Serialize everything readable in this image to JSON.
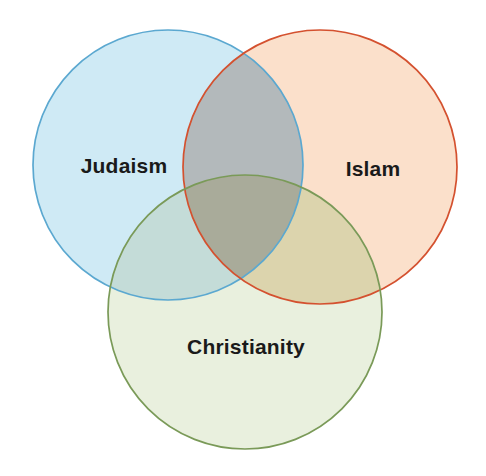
{
  "diagram": {
    "type": "venn",
    "set_count": 3,
    "background_color": "#ffffff",
    "width": 486,
    "height": 476,
    "sets": [
      {
        "id": "judaism",
        "label": "Judaism",
        "fill_color": "#cfeaf5",
        "stroke_color": "#5ba8d0",
        "label_color": "#1a1a1a",
        "center_x": 168,
        "center_y": 165,
        "radius": 135,
        "label_x": 124,
        "label_y": 166
      },
      {
        "id": "islam",
        "label": "Islam",
        "fill_color": "#fbe0cb",
        "stroke_color": "#d4512f",
        "label_color": "#1a1a1a",
        "center_x": 320,
        "center_y": 167,
        "radius": 137,
        "label_x": 373,
        "label_y": 169
      },
      {
        "id": "christianity",
        "label": "Christianity",
        "fill_color": "#e9f0de",
        "stroke_color": "#7a9a58",
        "label_color": "#1a1a1a",
        "center_x": 245,
        "center_y": 312,
        "radius": 137,
        "label_x": 246,
        "label_y": 347
      }
    ],
    "intersections": [
      {
        "id": "judaism-islam",
        "sets": [
          "judaism",
          "islam"
        ],
        "fill_color": "#b3b9bb",
        "label": ""
      },
      {
        "id": "judaism-christianity",
        "sets": [
          "judaism",
          "christianity"
        ],
        "fill_color": "#c4dcd8",
        "label": ""
      },
      {
        "id": "islam-christianity",
        "sets": [
          "islam",
          "christianity"
        ],
        "fill_color": "#dcd4ad",
        "label": ""
      },
      {
        "id": "judaism-islam-christianity",
        "sets": [
          "judaism",
          "islam",
          "christianity"
        ],
        "fill_color": "#a9ab9a",
        "label": ""
      }
    ]
  },
  "chart_data": {
    "type": "venn",
    "title": "",
    "subtitle": "",
    "xlabel": "",
    "ylabel": "",
    "legend": [],
    "categories": [
      "Judaism",
      "Islam",
      "Christianity"
    ],
    "annotations": [],
    "regions": [
      {
        "name": "Judaism only",
        "members": [
          "Judaism"
        ],
        "label": ""
      },
      {
        "name": "Islam only",
        "members": [
          "Islam"
        ],
        "label": ""
      },
      {
        "name": "Christianity only",
        "members": [
          "Christianity"
        ],
        "label": ""
      },
      {
        "name": "Judaism and Islam",
        "members": [
          "Judaism",
          "Islam"
        ],
        "label": ""
      },
      {
        "name": "Judaism and Christianity",
        "members": [
          "Judaism",
          "Christianity"
        ],
        "label": ""
      },
      {
        "name": "Islam and Christianity",
        "members": [
          "Islam",
          "Christianity"
        ],
        "label": ""
      },
      {
        "name": "All three",
        "members": [
          "Judaism",
          "Islam",
          "Christianity"
        ],
        "label": ""
      }
    ]
  }
}
